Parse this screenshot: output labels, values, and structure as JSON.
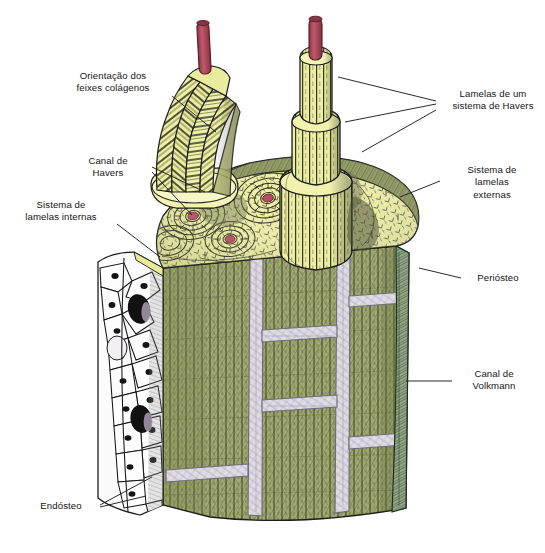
{
  "figure": {
    "language": "pt-BR"
  },
  "labels": [
    {
      "id": "orientacao-feixes-colagenos",
      "text": "Orientação dos\nfeixes colágenos",
      "side": "left",
      "x": 57,
      "y": 70,
      "w": 112,
      "leaders": [
        [
          172,
          96,
          216,
          132
        ]
      ]
    },
    {
      "id": "canal-de-havers",
      "text": "Canal de\nHavers",
      "side": "left",
      "x": 68,
      "y": 155,
      "w": 80,
      "leaders": [
        [
          152,
          167,
          205,
          192
        ],
        [
          152,
          172,
          192,
          215
        ]
      ]
    },
    {
      "id": "sistema-lamelas-internas",
      "text": "Sistema de\nlamelas internas",
      "side": "left",
      "x": 8,
      "y": 199,
      "w": 106,
      "leaders": [
        [
          117,
          224,
          160,
          257
        ]
      ]
    },
    {
      "id": "endosteo",
      "text": "Endósteo",
      "side": "left",
      "x": 28,
      "y": 500,
      "w": 66,
      "leaders": [
        [
          100,
          505,
          152,
          477
        ],
        [
          100,
          507,
          146,
          496
        ]
      ]
    },
    {
      "id": "lamelas-sistema-havers",
      "text": "Lamelas de um\nsistema de Havers",
      "side": "right",
      "x": 443,
      "y": 88,
      "w": 100,
      "leaders": [
        [
          436,
          101,
          338,
          77
        ],
        [
          436,
          104,
          345,
          122
        ],
        [
          436,
          110,
          362,
          152
        ]
      ]
    },
    {
      "id": "sistema-lamelas-externas",
      "text": "Sistema de\nlamelas\nexternas",
      "side": "right",
      "x": 446,
      "y": 164,
      "w": 92,
      "leaders": [
        [
          440,
          181,
          400,
          197
        ]
      ]
    },
    {
      "id": "periosteo",
      "text": "Periósteo",
      "side": "right",
      "x": 465,
      "y": 272,
      "w": 66,
      "leaders": [
        [
          461,
          278,
          419,
          268
        ]
      ]
    },
    {
      "id": "canal-de-volkmann",
      "text": "Canal de\nVolkmann",
      "side": "right",
      "x": 458,
      "y": 368,
      "w": 72,
      "leaders": [
        [
          452,
          381,
          406,
          381
        ]
      ]
    }
  ],
  "colors": {
    "ink": "#151515",
    "leader": "#1d1d1d",
    "cut_surface_yellow": "#eef0a6",
    "cut_surface_yellow_deep": "#e4e792",
    "haversian_canal_red": "#b8455c",
    "vessel_red": "#b0495a",
    "outer_olive": "#9aa469",
    "outer_olive_dark": "#848e55",
    "periosteum_green": "#8fa383",
    "periosteum_green_dark": "#6f8568",
    "volkmann_canal": "#ded9e4",
    "volkmann_edge": "#7d7a86",
    "endosteum_white": "#fbfbfb",
    "endosteum_cell_stroke": "#1b1b1b",
    "shadow_gray": "#5d6055",
    "lamella_shade": "#cfd08a",
    "background": "#ffffff"
  },
  "regions": [
    {
      "id": "osteon-column-left",
      "name": "Osteon em corte com feixes colágenos"
    },
    {
      "id": "osteon-column-right",
      "name": "Osteon cilíndrico com canal de Havers"
    },
    {
      "id": "top-cut-surface",
      "name": "Superfície de corte transversal"
    },
    {
      "id": "front-face",
      "name": "Face longitudinal externa"
    },
    {
      "id": "endosteum-face",
      "name": "Superfície endosteal"
    },
    {
      "id": "periosteum-edge",
      "name": "Borda periosteal"
    }
  ],
  "haversian_canals_top": [
    {
      "cx": 193,
      "cy": 216,
      "r": 5.2
    },
    {
      "cx": 230,
      "cy": 239,
      "r": 5.0
    },
    {
      "cx": 268,
      "cy": 198,
      "r": 5.4
    }
  ],
  "caption": {
    "partial_text": ""
  }
}
